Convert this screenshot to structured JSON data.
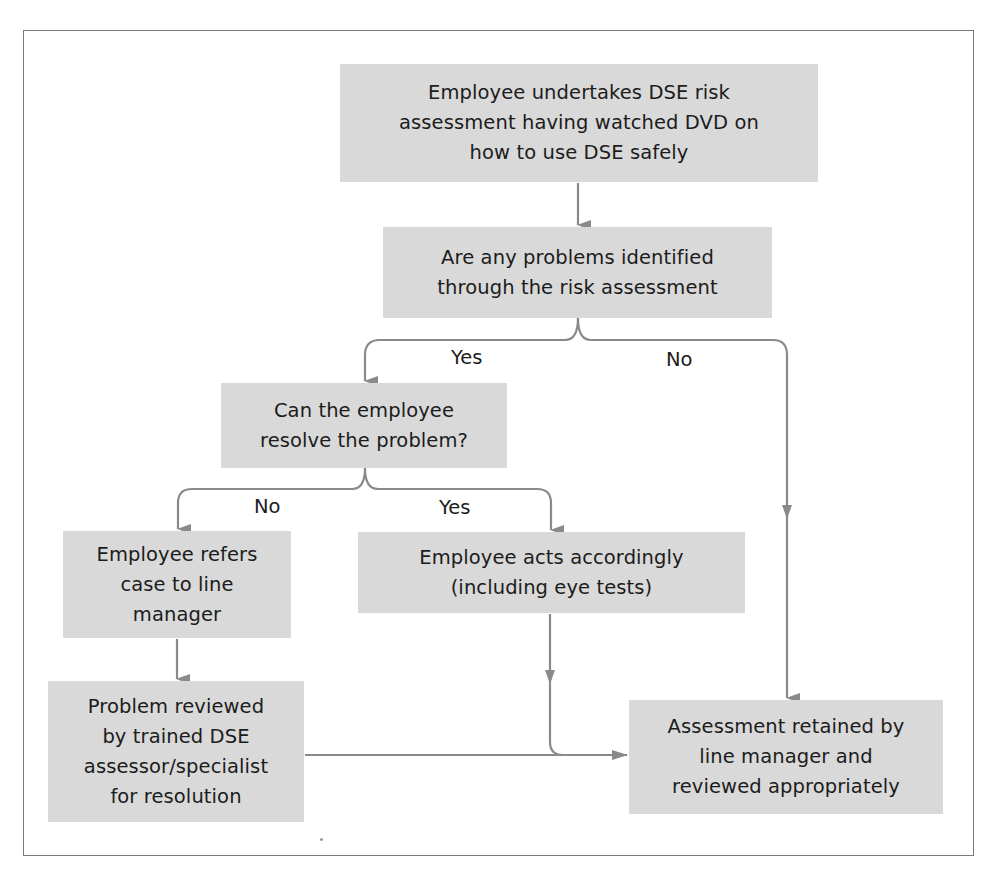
{
  "diagram": {
    "type": "flowchart",
    "colors": {
      "box_fill": "#d9d9d9",
      "connector": "#8a8a8a",
      "frame": "#7a7a7a",
      "text": "#1c1c1c"
    },
    "nodes": {
      "start": "Employee undertakes DSE risk\nassessment having watched DVD on\nhow to use DSE safely",
      "problems_identified": "Are any problems identified\nthrough the risk assessment",
      "can_resolve": "Can the employee\nresolve the problem?",
      "refer_line_manager": "Employee refers\ncase to line\nmanager",
      "acts_accordingly": "Employee acts accordingly\n(including eye tests)",
      "problem_reviewed": "Problem reviewed\nby trained DSE\nassessor/specialist\nfor resolution",
      "assessment_retained": "Assessment retained by\nline manager and\nreviewed appropriately"
    },
    "edge_labels": {
      "problems_yes": "Yes",
      "problems_no": "No",
      "resolve_no": "No",
      "resolve_yes": "Yes"
    },
    "edges": [
      {
        "from": "start",
        "to": "problems_identified",
        "label": ""
      },
      {
        "from": "problems_identified",
        "to": "can_resolve",
        "label": "Yes"
      },
      {
        "from": "problems_identified",
        "to": "assessment_retained",
        "label": "No"
      },
      {
        "from": "can_resolve",
        "to": "refer_line_manager",
        "label": "No"
      },
      {
        "from": "can_resolve",
        "to": "acts_accordingly",
        "label": "Yes"
      },
      {
        "from": "refer_line_manager",
        "to": "problem_reviewed",
        "label": ""
      },
      {
        "from": "problem_reviewed",
        "to": "assessment_retained",
        "label": ""
      },
      {
        "from": "acts_accordingly",
        "to": "assessment_retained",
        "label": ""
      }
    ]
  }
}
